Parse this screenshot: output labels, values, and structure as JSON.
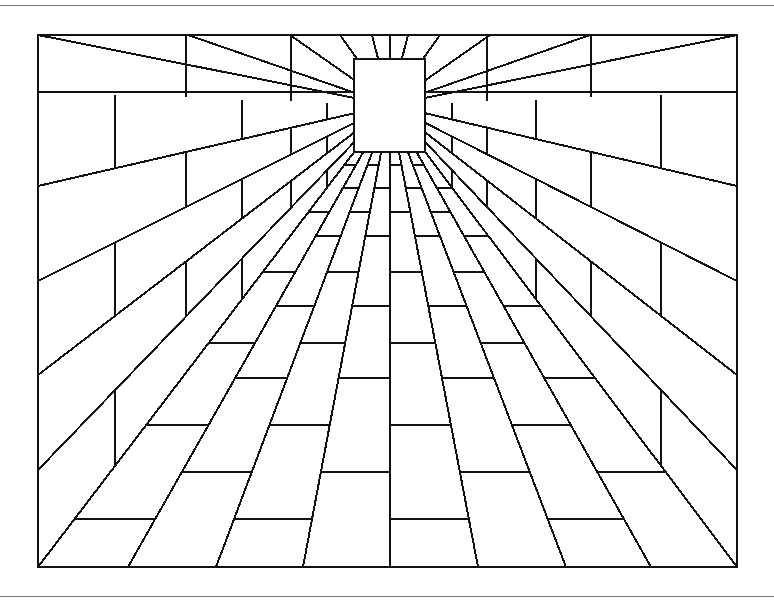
{
  "figure": {
    "colors": {
      "ink": "#111111",
      "paper": "#ffffff",
      "rule": "#7a7a7a"
    },
    "frame": {
      "x1": 38,
      "y1": 35,
      "x2": 737,
      "y2": 567
    },
    "back_wall": {
      "x1": 354,
      "y1": 59,
      "x2": 425,
      "y2": 152
    },
    "vanishing_point": {
      "x": 390,
      "y": 105
    },
    "wall_course_edges_y": [
      92,
      186,
      281,
      375,
      470
    ],
    "ceiling_edges_x": [
      188,
      290,
      340,
      372,
      390,
      408,
      440,
      490,
      590
    ],
    "floor_edges_x": [
      128,
      216,
      303,
      390,
      478,
      566,
      651
    ],
    "floor_cross_y": [
      165,
      188,
      212,
      236,
      272,
      306,
      343,
      378,
      425,
      472,
      519
    ],
    "wall_joint_depths": [
      0.0,
      0.22,
      0.42,
      0.58,
      0.72,
      0.82,
      0.9
    ]
  }
}
